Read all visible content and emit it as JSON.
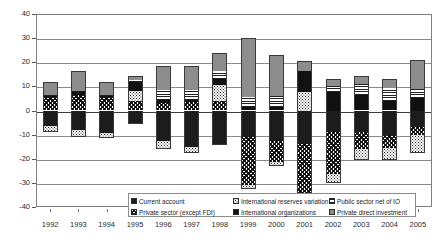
{
  "chart_data": {
    "type": "bar",
    "subtype": "stacked-bar-positive-negative",
    "title": "",
    "xlabel": "",
    "ylabel": "",
    "ylim": [
      -40,
      40
    ],
    "ytick_step": 10,
    "yticks": [
      40,
      30,
      20,
      10,
      0,
      -10,
      -20,
      -30,
      -40
    ],
    "grid": true,
    "legend_position": "bottom",
    "categories": [
      "1992",
      "1993",
      "1994",
      "1995",
      "1996",
      "1997",
      "1998",
      "1999",
      "2000",
      "2001",
      "2002",
      "2003",
      "2004",
      "2005"
    ],
    "series": [
      {
        "name": "Current account",
        "pattern": "solid-black",
        "values": [
          -6.5,
          -8.0,
          -9.5,
          -5.5,
          -12.5,
          -15.0,
          -14.5,
          -11.0,
          -12.5,
          -14.0,
          -9.0,
          -9.0,
          -10.0,
          -7.0
        ]
      },
      {
        "name": "Private sector (except FDI)",
        "pattern": "dense-diagonal-cross",
        "values": [
          5.5,
          6.5,
          5.5,
          4.0,
          3.0,
          3.5,
          4.0,
          -20.0,
          -9.0,
          -26.0,
          -17.5,
          -7.0,
          -5.5,
          -3.0
        ]
      },
      {
        "name": "International reserves variation",
        "pattern": "dotted",
        "values": [
          -2.5,
          -3.0,
          -2.0,
          4.0,
          -3.5,
          -2.5,
          6.5,
          -1.5,
          -1.5,
          7.5,
          -3.5,
          -4.5,
          -5.0,
          -7.5
        ]
      },
      {
        "name": "International organizations",
        "pattern": "solid-dark",
        "values": [
          0.5,
          1.0,
          0.5,
          4.0,
          1.5,
          1.0,
          2.5,
          1.5,
          1.5,
          9.0,
          7.5,
          6.5,
          4.0,
          5.0
        ]
      },
      {
        "name": "Public sector net of IO",
        "pattern": "horizontal-lines",
        "values": [
          0.5,
          0.5,
          0.5,
          0.5,
          4.0,
          4.0,
          3.5,
          4.0,
          4.5,
          -1.0,
          2.5,
          4.5,
          5.5,
          4.0
        ]
      },
      {
        "name": "Private direct investment",
        "pattern": "grey-solid",
        "values": [
          5.5,
          8.5,
          5.5,
          2.0,
          10.0,
          10.0,
          7.5,
          24.5,
          17.0,
          4.0,
          3.0,
          3.5,
          3.5,
          12.0
        ]
      }
    ]
  },
  "axis": {
    "y_labels": [
      "40",
      "30",
      "20",
      "10",
      "0",
      "-10",
      "-20",
      "-30",
      "-40"
    ],
    "x_labels": [
      "1992",
      "1993",
      "1994",
      "1995",
      "1996",
      "1997",
      "1998",
      "1999",
      "2000",
      "2001",
      "2002",
      "2003",
      "2004",
      "2005"
    ]
  },
  "legend": {
    "column1": [
      {
        "label": "Current account",
        "pattern": "solid-black"
      },
      {
        "label": "Private sector (except FDI)",
        "pattern": "dense-diagonal-cross"
      }
    ],
    "column2": [
      {
        "label": "International reserves variation",
        "pattern": "dotted"
      },
      {
        "label": "International organizations",
        "pattern": "solid-dark"
      }
    ],
    "column3": [
      {
        "label": "Public sector net of IO",
        "pattern": "horizontal-lines"
      },
      {
        "label": "Private direct investment",
        "pattern": "grey-solid"
      }
    ]
  },
  "colors": {
    "gridline": "#8a8a8a",
    "axis": "#808080",
    "zero_line": "#3c3c3c",
    "text": "#2b2b2b",
    "series_black": "#1c1c1c",
    "series_grey": "#8d8d8d"
  }
}
